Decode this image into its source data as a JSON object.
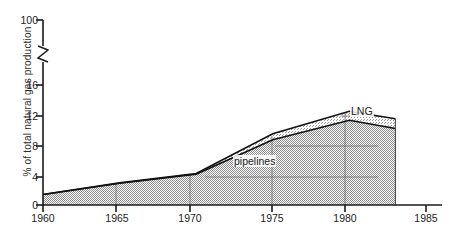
{
  "chart_data": {
    "type": "area",
    "title": "",
    "subtitle": "",
    "xlabel": "",
    "ylabel": "% of total natural gas production",
    "x": [
      1960,
      1965,
      1970,
      1975,
      1980,
      1983
    ],
    "xlim": [
      1960,
      1985
    ],
    "ylim": [
      0,
      16
    ],
    "axis_break": {
      "present": true,
      "below": 16,
      "above": 100,
      "symbol": "zigzag"
    },
    "grid": true,
    "legend_position": "inline-annotations",
    "stacked": true,
    "series": [
      {
        "name": "pipelines",
        "values": [
          1.4,
          2.9,
          4.1,
          8.7,
          11.3,
          10.2
        ],
        "fill": "gray-stipple"
      },
      {
        "name": "LNG",
        "values": [
          0.0,
          0.05,
          0.1,
          0.8,
          1.2,
          1.3
        ],
        "fill": "gray-stipple-light",
        "note": "upper band; cumulative top values 1.4, 2.95, 4.2, 9.5, 12.5, 11.5"
      }
    ],
    "cumulative_top": [
      1.4,
      2.95,
      4.2,
      9.5,
      12.5,
      11.5
    ],
    "xticks": [
      "1960",
      "1965",
      "1970",
      "1975",
      "1980",
      "1985"
    ],
    "yticks": [
      "0",
      "4",
      "8",
      "12",
      "16",
      "100"
    ],
    "annotations": [
      {
        "text": "LNG",
        "x": 1981.2,
        "y": 11.9
      },
      {
        "text": "pipelines",
        "x": 1976.0,
        "y": 6.6
      }
    ]
  },
  "axes": {
    "y_title": "% of total natural gas production",
    "y_ticks": [
      {
        "label": "0",
        "value": 0
      },
      {
        "label": "4",
        "value": 4
      },
      {
        "label": "8",
        "value": 8
      },
      {
        "label": "12",
        "value": 12
      },
      {
        "label": "16",
        "value": 16
      },
      {
        "label": "100",
        "value": 100
      }
    ],
    "x_ticks": [
      {
        "label": "1960",
        "value": 1960
      },
      {
        "label": "1965",
        "value": 1965
      },
      {
        "label": "1970",
        "value": 1970
      },
      {
        "label": "1975",
        "value": 1975
      },
      {
        "label": "1980",
        "value": 1980
      },
      {
        "label": "1985",
        "value": 1985
      }
    ]
  },
  "labels": {
    "lng": "LNG",
    "pipelines": "pipelines"
  },
  "colors": {
    "axis": "#1a1a1a",
    "gridline": "#6e6e6e",
    "curve": "#111111",
    "fill_lower": "#b9b9b9",
    "fill_upper": "#d2d2d2",
    "background": "#ffffff",
    "text": "#1c1c1c"
  }
}
